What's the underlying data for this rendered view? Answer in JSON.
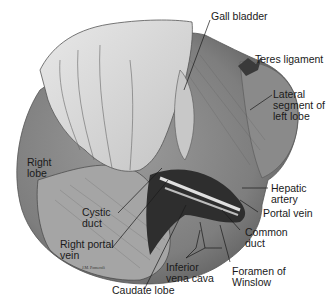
{
  "figure": {
    "type": "anatomical illustration",
    "signature": "J.M. Pomeroli",
    "colors": {
      "liver_fill": "#8c8c8c",
      "liver_dark": "#4a4a4a",
      "hand_fill": "#d8d8d8",
      "line": "#1a1a1a",
      "background": "#ffffff"
    }
  },
  "labels": {
    "gall_bladder": "Gall bladder",
    "teres_ligament": "Teres ligament",
    "lateral_segment": "Lateral\nsegment of\nleft lobe",
    "right_lobe": "Right\nlobe",
    "hepatic_artery": "Hepatic\nartery",
    "portal_vein": "Portal vein",
    "cystic_duct": "Cystic\nduct",
    "common_duct": "Common\nduct",
    "right_portal_vein": "Right portal\nvein",
    "inferior_vena_cava": "Inferior\nvena cava",
    "foramen_of_winslow": "Foramen of\nWinslow",
    "caudate_lobe": "Caudate lobe"
  }
}
